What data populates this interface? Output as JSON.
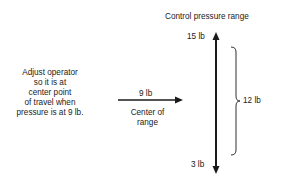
{
  "title": "Control pressure range",
  "instruction_lines": [
    "Adjust operator",
    "so it is at",
    "center point",
    "of travel when",
    "pressure is at 9 lb."
  ],
  "labels": {
    "top": "15 lb",
    "bottom": "3 lb",
    "span": "12 lb",
    "setpoint": "9 lb",
    "center_line1": "Center of",
    "center_line2": "range"
  },
  "colors": {
    "ink": "#1a1a1a",
    "background": "#ffffff"
  }
}
